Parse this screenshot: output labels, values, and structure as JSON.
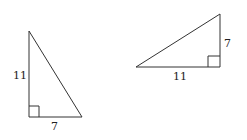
{
  "figures": [
    {
      "name": "left-triangle",
      "legs": {
        "vertical": "11",
        "horizontal": "7"
      },
      "right_angle": "bottom-left"
    },
    {
      "name": "right-triangle",
      "legs": {
        "horizontal": "11",
        "vertical": "7"
      },
      "right_angle": "bottom-right"
    }
  ],
  "colors": {
    "stroke": "#333333",
    "background": "#ffffff"
  }
}
